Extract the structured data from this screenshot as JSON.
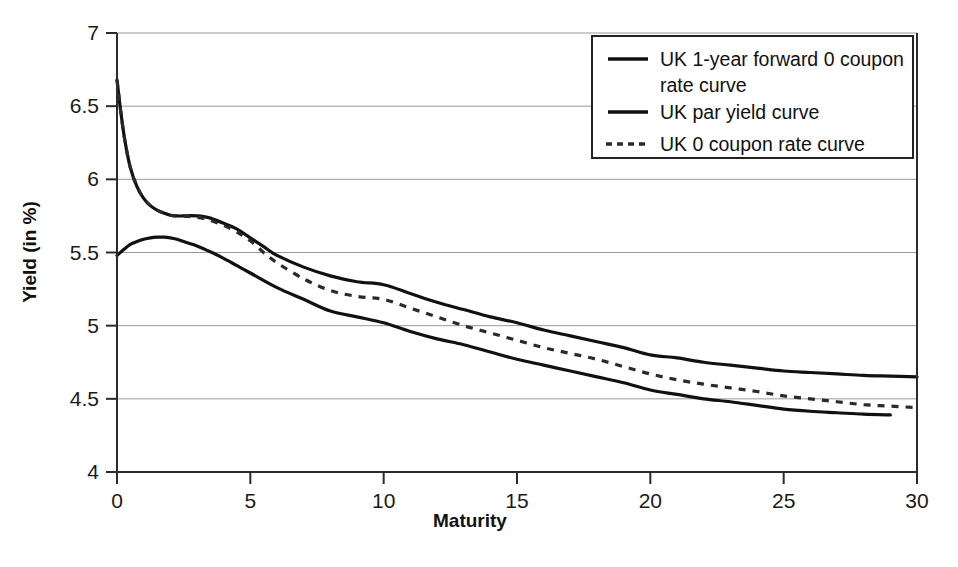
{
  "chart_data": {
    "type": "line",
    "title": "",
    "xlabel": "Maturity",
    "ylabel": "Yield (in %)",
    "xlim": [
      0,
      30
    ],
    "ylim": [
      4,
      7
    ],
    "xticks": [
      "0",
      "5",
      "10",
      "15",
      "20",
      "25",
      "30"
    ],
    "yticks": [
      "4",
      "4.5",
      "5",
      "5.5",
      "6",
      "6.5",
      "7"
    ],
    "grid": true,
    "legend_position": "top-right",
    "series": [
      {
        "name": "UK 1-year forward 0 coupon rate curve",
        "style": "solid",
        "color": "#111111",
        "x": [
          0,
          0.15,
          0.3,
          0.5,
          0.75,
          1,
          1.25,
          1.5,
          1.75,
          2,
          2.25,
          2.5,
          2.75,
          3,
          3.25,
          3.5,
          4,
          4.5,
          5,
          5.5,
          6,
          7,
          8,
          9,
          10,
          11,
          12,
          13,
          14,
          15,
          16,
          17,
          18,
          19,
          20,
          21,
          22,
          23,
          24,
          25,
          26,
          27,
          28,
          29,
          30
        ],
        "y": [
          6.68,
          6.45,
          6.26,
          6.08,
          5.95,
          5.87,
          5.82,
          5.79,
          5.77,
          5.755,
          5.75,
          5.75,
          5.752,
          5.75,
          5.745,
          5.735,
          5.7,
          5.66,
          5.6,
          5.54,
          5.48,
          5.4,
          5.34,
          5.3,
          5.28,
          5.22,
          5.16,
          5.11,
          5.06,
          5.02,
          4.97,
          4.93,
          4.89,
          4.85,
          4.8,
          4.78,
          4.75,
          4.73,
          4.71,
          4.69,
          4.68,
          4.67,
          4.66,
          4.655,
          4.65
        ]
      },
      {
        "name": "UK par yield curve",
        "style": "solid",
        "color": "#111111",
        "x": [
          0,
          0.25,
          0.5,
          0.75,
          1,
          1.25,
          1.5,
          1.75,
          2,
          2.25,
          2.5,
          3,
          3.5,
          4,
          4.5,
          5,
          6,
          7,
          8,
          9,
          10,
          11,
          12,
          13,
          14,
          15,
          16,
          17,
          18,
          19,
          20,
          21,
          22,
          23,
          24,
          25,
          26,
          27,
          28,
          29
        ],
        "y": [
          5.48,
          5.52,
          5.555,
          5.575,
          5.59,
          5.6,
          5.605,
          5.605,
          5.6,
          5.59,
          5.575,
          5.545,
          5.505,
          5.46,
          5.41,
          5.36,
          5.26,
          5.18,
          5.1,
          5.06,
          5.02,
          4.96,
          4.91,
          4.87,
          4.82,
          4.77,
          4.73,
          4.69,
          4.65,
          4.61,
          4.56,
          4.53,
          4.5,
          4.48,
          4.455,
          4.43,
          4.415,
          4.405,
          4.395,
          4.39
        ]
      },
      {
        "name": "UK 0 coupon rate curve",
        "style": "dashed",
        "color": "#2a2a2a",
        "x": [
          0,
          0.15,
          0.3,
          0.5,
          0.75,
          1,
          1.25,
          1.5,
          1.75,
          2,
          2.25,
          2.5,
          2.75,
          3,
          3.25,
          3.5,
          4,
          4.5,
          5,
          5.5,
          6,
          7,
          8,
          9,
          10,
          11,
          12,
          13,
          14,
          15,
          16,
          17,
          18,
          19,
          20,
          21,
          22,
          23,
          24,
          25,
          26,
          27,
          28,
          29,
          30
        ],
        "y": [
          6.68,
          6.45,
          6.26,
          6.08,
          5.95,
          5.87,
          5.82,
          5.79,
          5.77,
          5.755,
          5.75,
          5.748,
          5.745,
          5.74,
          5.732,
          5.72,
          5.685,
          5.64,
          5.58,
          5.5,
          5.43,
          5.32,
          5.24,
          5.2,
          5.18,
          5.12,
          5.06,
          5.0,
          4.95,
          4.9,
          4.85,
          4.81,
          4.77,
          4.72,
          4.67,
          4.63,
          4.6,
          4.575,
          4.55,
          4.52,
          4.5,
          4.48,
          4.46,
          4.45,
          4.44
        ]
      }
    ],
    "legend_entries": [
      {
        "label_line1": "UK 1-year forward 0 coupon",
        "label_line2": "rate curve",
        "style": "solid"
      },
      {
        "label_line1": "UK par yield curve",
        "label_line2": "",
        "style": "solid"
      },
      {
        "label_line1": "UK 0 coupon rate curve",
        "label_line2": "",
        "style": "dashed"
      }
    ]
  }
}
